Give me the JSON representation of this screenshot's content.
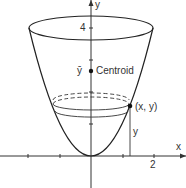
{
  "figure": {
    "type": "paraboloid-centroid-diagram",
    "curve": "y = x^2",
    "axes": {
      "x_label": "x",
      "y_label": "y",
      "x_tick_label": "2",
      "y_tick_label": "4"
    },
    "labels": {
      "ybar": "ȳ",
      "centroid": "Centroid",
      "point": "(x, y)",
      "height": "y"
    },
    "colors": {
      "line": "#222222",
      "axis": "#333333",
      "background": "#ffffff"
    }
  }
}
